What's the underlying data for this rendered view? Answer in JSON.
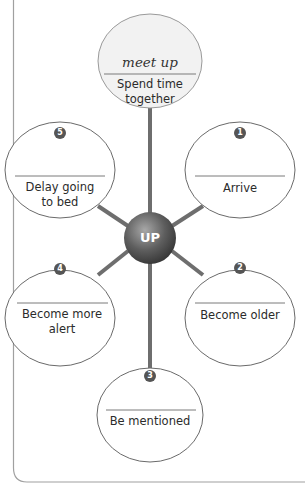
{
  "diagram": {
    "center": {
      "label": "UP"
    },
    "top_node": {
      "phrasal_verb": "meet up",
      "definition_line1": "Spend time",
      "definition_line2": "together"
    },
    "nodes": [
      {
        "number": "1",
        "answer": "",
        "definition_line1": "Arrive",
        "definition_line2": ""
      },
      {
        "number": "2",
        "answer": "",
        "definition_line1": "Become older",
        "definition_line2": ""
      },
      {
        "number": "3",
        "answer": "",
        "definition_line1": "Be mentioned",
        "definition_line2": ""
      },
      {
        "number": "4",
        "answer": "",
        "definition_line1": "Become more",
        "definition_line2": "alert"
      },
      {
        "number": "5",
        "answer": "",
        "definition_line1": "Delay going",
        "definition_line2": "to bed"
      }
    ],
    "colors": {
      "spoke": "#6e6e6e",
      "outline": "#6a6a6a",
      "top_fill": "#f2f2f2",
      "badge": "#555555",
      "sphere_dark": "#3c3c3c",
      "sphere_light": "#9a9a9a",
      "frame": "#9a9a9a"
    }
  }
}
